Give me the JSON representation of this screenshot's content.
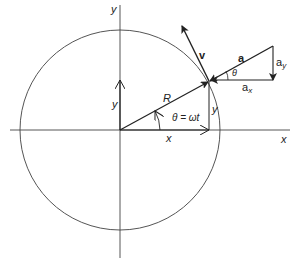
{
  "diagram": {
    "axes": {
      "x_label": "x",
      "y_label": "y"
    },
    "labels": {
      "radius": "R",
      "angle_eq": "θ = ωt",
      "x_component": "x",
      "y_component_left": "y",
      "y_component_right": "y",
      "velocity": "v",
      "acceleration": "a",
      "acceleration_x_base": "a",
      "acceleration_x_sub": "x",
      "acceleration_y_base": "a",
      "acceleration_y_sub": "y",
      "theta_small": "θ"
    },
    "colors": {
      "stroke": "#222222",
      "circle": "#555555",
      "background": "#ffffff"
    }
  }
}
